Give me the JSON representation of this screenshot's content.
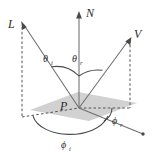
{
  "figure": {
    "type": "vector-geometry-diagram",
    "background_color": "#ffffff",
    "plane_color": "#c9c9c9",
    "line_color": "#6e6e6e",
    "label_color": "#2b2b2b"
  },
  "labels": {
    "light_vector": "L",
    "normal_vector": "N",
    "view_vector": "V",
    "surface_point": "P",
    "theta": "θ",
    "phi": "ϕ",
    "subscript_incident": "i",
    "subscript_reflected": "r"
  },
  "annotations": [
    {
      "name": "light-direction",
      "symbol": "L",
      "subscript": ""
    },
    {
      "name": "surface-normal",
      "symbol": "N",
      "subscript": ""
    },
    {
      "name": "view-direction",
      "symbol": "V",
      "subscript": ""
    },
    {
      "name": "surface-point",
      "symbol": "P",
      "subscript": ""
    },
    {
      "name": "incident-polar-angle",
      "symbol": "θ",
      "subscript": "i"
    },
    {
      "name": "reflected-polar-angle",
      "symbol": "θ",
      "subscript": "r"
    },
    {
      "name": "incident-azimuth-angle",
      "symbol": "ϕ",
      "subscript": "i"
    },
    {
      "name": "reflected-azimuth-angle",
      "symbol": "ϕ",
      "subscript": "r"
    }
  ]
}
